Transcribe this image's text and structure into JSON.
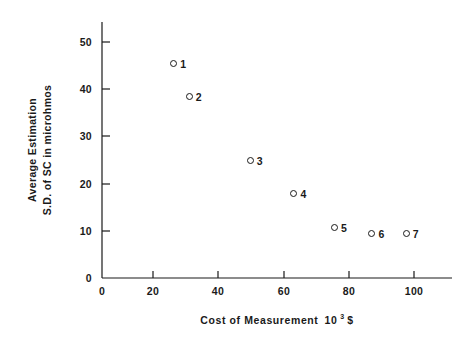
{
  "chart_data": {
    "type": "scatter",
    "title": "",
    "xlabel": "Cost of Measurement  10³ $",
    "xlabel_prefix": "Cost of Measurement",
    "xlabel_base": "10",
    "xlabel_exponent": "3",
    "xlabel_suffix": "$",
    "ylabel": "Average Estimation S.D. of SC in microhmos",
    "ylabel_line1": "Average  Estimation",
    "ylabel_line2": "S.D. of SC in microhmos",
    "xlim": [
      0,
      113
    ],
    "ylim": [
      0,
      53
    ],
    "xticks": [
      0,
      20,
      40,
      60,
      80,
      100
    ],
    "xtick_labels": [
      "0",
      "20",
      "40",
      "60",
      "80",
      "100"
    ],
    "yticks": [
      0,
      10,
      20,
      30,
      40,
      50
    ],
    "ytick_labels": [
      "0",
      "10",
      "20",
      "30",
      "40",
      "50"
    ],
    "grid": false,
    "legend": "none",
    "marker": "open-circle",
    "points": [
      {
        "label": "1",
        "x": 23.0,
        "y": 46.5
      },
      {
        "label": "2",
        "x": 28.0,
        "y": 39.5
      },
      {
        "label": "3",
        "x": 47.5,
        "y": 26.0
      },
      {
        "label": "4",
        "x": 61.5,
        "y": 19.0
      },
      {
        "label": "5",
        "x": 74.5,
        "y": 11.8
      },
      {
        "label": "6",
        "x": 86.5,
        "y": 10.5
      },
      {
        "label": "7",
        "x": 97.5,
        "y": 10.5
      }
    ],
    "axis_color": "#1a1a1a"
  }
}
